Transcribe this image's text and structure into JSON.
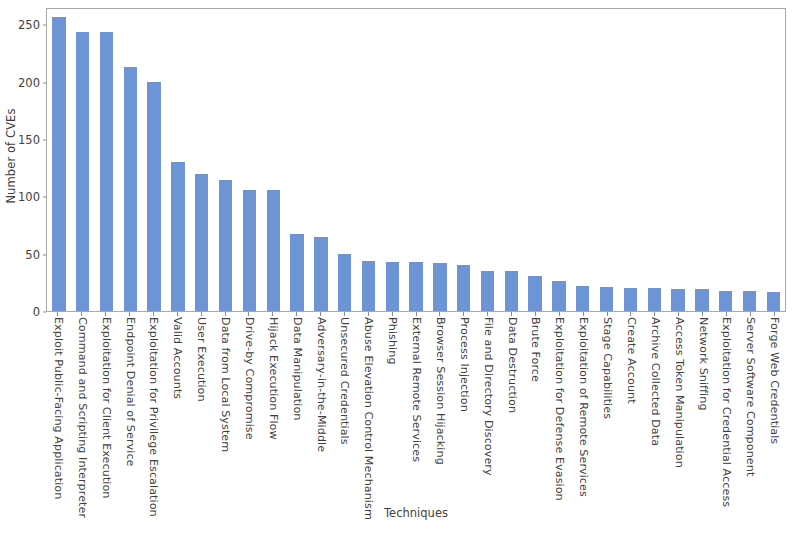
{
  "chart_data": {
    "type": "bar",
    "title": "",
    "xlabel": "Techniques",
    "ylabel": "Number of CVEs",
    "ylim": [
      0,
      265
    ],
    "yticks": [
      0,
      50,
      100,
      150,
      200,
      250
    ],
    "grid": false,
    "legend": null,
    "bar_color": "#6d94d4",
    "categories": [
      "Exploit Public-Facing Application",
      "Command and Scripting Interpreter",
      "Exploitation for Client Execution",
      "Endpoint Denial of Service",
      "Exploitation for Privilege Escalation",
      "Valid Accounts",
      "User Execution",
      "Data from Local System",
      "Drive-by Compromise",
      "Hijack Execution Flow",
      "Data Manipulation",
      "Adversary-in-the-Middle",
      "Unsecured Credentials",
      "Abuse Elevation Control Mechanism",
      "Phishing",
      "External Remote Services",
      "Browser Session Hijacking",
      "Process Injection",
      "File and Directory Discovery",
      "Data Destruction",
      "Brute Force",
      "Exploitation for Defense Evasion",
      "Exploitation of Remote Services",
      "Stage Capabilities",
      "Create Account",
      "Archive Collected Data",
      "Access Token Manipulation",
      "Network Sniffing",
      "Exploitation for Credential Access",
      "Server Software Component",
      "Forge Web Credentials"
    ],
    "values": [
      258,
      245,
      245,
      214,
      201,
      131,
      120,
      115,
      106,
      106,
      68,
      65,
      50,
      44,
      43,
      43,
      42,
      40,
      35,
      35,
      31,
      26,
      22,
      21,
      20,
      20,
      19,
      19,
      18,
      18,
      17
    ]
  }
}
